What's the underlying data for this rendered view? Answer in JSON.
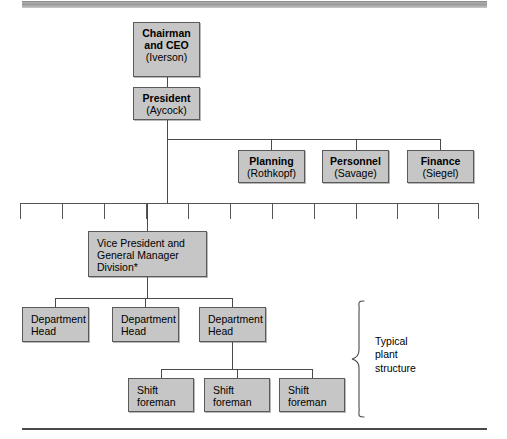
{
  "chart_meta": {
    "kind": "organization-chart",
    "title": "Corporate organization chart",
    "box_fill": "#c6c6c6",
    "box_border": "#5a5a5a",
    "line_color": "#4a4a4a",
    "background": "#ffffff"
  },
  "rules": {
    "top_bar_label": "top-decorative-rule",
    "bottom_bar_label": "bottom-decorative-rule"
  },
  "nodes": {
    "chairman": {
      "title": "Chairman",
      "title2": "and CEO",
      "name": "(Iverson)"
    },
    "president": {
      "title": "President",
      "name": "(Aycock)"
    },
    "staff": [
      {
        "title": "Planning",
        "name": "(Rothkopf)"
      },
      {
        "title": "Personnel",
        "name": "(Savage)"
      },
      {
        "title": "Finance",
        "name": "(Siegel)"
      }
    ],
    "vice_president": {
      "line1": "Vice President and",
      "line2": "General Manager",
      "line3": "Division*"
    },
    "department_heads": [
      {
        "line1": "Department",
        "line2": "Head"
      },
      {
        "line1": "Department",
        "line2": "Head"
      },
      {
        "line1": "Department",
        "line2": "Head"
      }
    ],
    "shift_foremen": [
      {
        "line1": "Shift",
        "line2": "foreman"
      },
      {
        "line1": "Shift",
        "line2": "foreman"
      },
      {
        "line1": "Shift",
        "line2": "foreman"
      }
    ]
  },
  "annotations": {
    "typical_plant_structure": "Typical\nplant\nstructure",
    "brace_label": "grouping-brace"
  },
  "division_bar": {
    "description": "horizontal distribution bar with 12 division stubs",
    "stub_count": 12
  }
}
